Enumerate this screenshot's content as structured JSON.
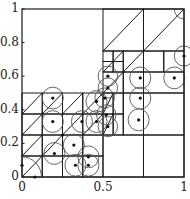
{
  "figure": {
    "type": "adaptive-partition-diagram",
    "domain": {
      "x": [
        0,
        1
      ],
      "y": [
        0,
        1
      ]
    },
    "colors": {
      "line": "#1a1a1a",
      "circle": "#555555",
      "dot": "#111111",
      "background": "#ffffff"
    },
    "x_ticks": [
      {
        "value": 0,
        "label": "0"
      },
      {
        "value": 0.5,
        "label": "0.5"
      },
      {
        "value": 1,
        "label": "1"
      }
    ],
    "y_ticks": [
      {
        "value": 0,
        "label": "0"
      },
      {
        "value": 0.2,
        "label": "0.2"
      },
      {
        "value": 0.4,
        "label": "0.4"
      },
      {
        "value": 0.6,
        "label": "0.6"
      },
      {
        "value": 0.8,
        "label": "0.8"
      },
      {
        "value": 1,
        "label": "1"
      }
    ],
    "cells": [
      [
        0.5,
        0.75,
        0.25,
        0.25
      ],
      [
        0.75,
        0.75,
        0.25,
        0.25
      ],
      [
        0.5,
        0.625,
        0.0625,
        0.0625
      ],
      [
        0.5625,
        0.625,
        0.0625,
        0.0625
      ],
      [
        0.5,
        0.6875,
        0.0625,
        0.0625
      ],
      [
        0.5625,
        0.6875,
        0.0625,
        0.0625
      ],
      [
        0.625,
        0.625,
        0.125,
        0.125
      ],
      [
        0.75,
        0.625,
        0.125,
        0.125
      ],
      [
        0.875,
        0.625,
        0.125,
        0.125
      ],
      [
        0.5,
        0.5,
        0.125,
        0.125
      ],
      [
        0.625,
        0.5,
        0.125,
        0.125
      ],
      [
        0.75,
        0.5,
        0.25,
        0.125
      ],
      [
        0,
        0,
        0.125,
        0.125
      ],
      [
        0.125,
        0,
        0.125,
        0.125
      ],
      [
        0.25,
        0,
        0.125,
        0.125
      ],
      [
        0.375,
        0,
        0.125,
        0.125
      ],
      [
        0,
        0.125,
        0.125,
        0.125
      ],
      [
        0.125,
        0.125,
        0.125,
        0.125
      ],
      [
        0.25,
        0.125,
        0.125,
        0.125
      ],
      [
        0.375,
        0.125,
        0.125,
        0.125
      ],
      [
        0,
        0.25,
        0.125,
        0.125
      ],
      [
        0.125,
        0.25,
        0.125,
        0.125
      ],
      [
        0.25,
        0.25,
        0.125,
        0.125
      ],
      [
        0.375,
        0.25,
        0.125,
        0.125
      ],
      [
        0,
        0.375,
        0.125,
        0.125
      ],
      [
        0.125,
        0.375,
        0.125,
        0.125
      ],
      [
        0.25,
        0.375,
        0.125,
        0.125
      ],
      [
        0.375,
        0.375,
        0.125,
        0.125
      ],
      [
        0.5,
        0.25,
        0.0625,
        0.125
      ],
      [
        0.5625,
        0.25,
        0.0625,
        0.125
      ],
      [
        0.5,
        0.375,
        0.0625,
        0.125
      ],
      [
        0.5625,
        0.375,
        0.0625,
        0.125
      ],
      [
        0.625,
        0.25,
        0.125,
        0.25
      ],
      [
        0.75,
        0.25,
        0.25,
        0.25
      ],
      [
        0.5,
        0,
        0.25,
        0.25
      ],
      [
        0.75,
        0,
        0.25,
        0.25
      ]
    ],
    "diagonals": [
      [
        0.5,
        0.75,
        0.75,
        1
      ],
      [
        0.75,
        0.75,
        1,
        1
      ],
      [
        0.5,
        0.5,
        0.75,
        0.75
      ],
      [
        0.5,
        0.625,
        0.5625,
        0.6875
      ],
      [
        0.5625,
        0.6875,
        0.625,
        0.75
      ],
      [
        0,
        0,
        0.125,
        0.125
      ],
      [
        0,
        0.125,
        0.125,
        0.25
      ],
      [
        0.125,
        0.125,
        0.25,
        0.25
      ],
      [
        0,
        0.25,
        0.125,
        0.375
      ],
      [
        0,
        0.375,
        0.125,
        0.5
      ],
      [
        0.125,
        0.375,
        0.25,
        0.5
      ],
      [
        0.25,
        0.25,
        0.375,
        0.375
      ],
      [
        0.25,
        0.375,
        0.375,
        0.5
      ],
      [
        0.375,
        0.375,
        0.5,
        0.5
      ],
      [
        0.375,
        0.25,
        0.5,
        0.375
      ],
      [
        0.5,
        0.375,
        0.5625,
        0.5
      ],
      [
        0.5,
        0.25,
        0.5625,
        0.375
      ]
    ],
    "points": [
      {
        "x": 0.0,
        "y": 0.07,
        "r": 0
      },
      {
        "x": 0.08,
        "y": 0.0,
        "r": 0
      },
      {
        "x": 0.19,
        "y": 0.47,
        "r": 0.065
      },
      {
        "x": 0.19,
        "y": 0.33,
        "r": 0.065
      },
      {
        "x": 0.37,
        "y": 0.33,
        "r": 0.065
      },
      {
        "x": 0.46,
        "y": 0.33,
        "r": 0.065
      },
      {
        "x": 0.46,
        "y": 0.45,
        "r": 0.065
      },
      {
        "x": 0.32,
        "y": 0.19,
        "r": 0.065
      },
      {
        "x": 0.25,
        "y": 0.25,
        "r": 0.0
      },
      {
        "x": 0.2,
        "y": 0.14,
        "r": 0.065
      },
      {
        "x": 0.33,
        "y": 0.07,
        "r": 0.065
      },
      {
        "x": 0.41,
        "y": 0.07,
        "r": 0.065
      },
      {
        "x": 0.41,
        "y": 0.12,
        "r": 0.065
      },
      {
        "x": 0.51,
        "y": 0.47,
        "r": 0.06
      },
      {
        "x": 0.52,
        "y": 0.37,
        "r": 0.06
      },
      {
        "x": 0.53,
        "y": 0.3,
        "r": 0.06
      },
      {
        "x": 0.53,
        "y": 0.6,
        "r": 0.06
      },
      {
        "x": 0.53,
        "y": 0.53,
        "r": 0.06
      },
      {
        "x": 0.73,
        "y": 0.59,
        "r": 0.065
      },
      {
        "x": 0.73,
        "y": 0.47,
        "r": 0.065
      },
      {
        "x": 0.72,
        "y": 0.34,
        "r": 0.065
      },
      {
        "x": 0.94,
        "y": 0.59,
        "r": 0.065
      },
      {
        "x": 1.0,
        "y": 0.72,
        "r": 0.06
      }
    ],
    "corner_arcs": [
      {
        "cx": 0,
        "cy": 0,
        "r": 0.12,
        "start": 0,
        "end": 90
      },
      {
        "cx": 1,
        "cy": 1,
        "r": 0.06,
        "start": 180,
        "end": 270
      }
    ]
  }
}
